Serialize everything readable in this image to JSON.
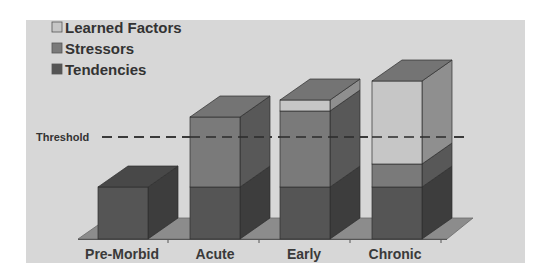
{
  "chart_data": {
    "type": "bar",
    "subtype": "stacked-3d",
    "title": "",
    "xlabel": "",
    "ylabel": "",
    "categories": [
      "Pre-Morbid",
      "Acute",
      "Early",
      "Chronic"
    ],
    "series": [
      {
        "name": "Tendencies",
        "values": [
          52,
          52,
          52,
          52
        ],
        "color": "#555555"
      },
      {
        "name": "Stressors",
        "values": [
          0,
          70,
          76,
          23
        ],
        "color": "#7a7a7a"
      },
      {
        "name": "Learned Factors",
        "values": [
          0,
          0,
          11,
          83
        ],
        "color": "#c6c6c6"
      }
    ],
    "legend": {
      "position": "top-left",
      "entries": [
        "Learned Factors",
        "Stressors",
        "Tendencies"
      ]
    },
    "annotations": [
      {
        "type": "hline",
        "label": "Threshold",
        "value": 102,
        "style": "dashed"
      }
    ],
    "ylim": [
      0,
      160
    ],
    "grid": false,
    "axis_ticks_visible": false
  },
  "colors": {
    "background": "#d7d7d7",
    "floor": "#8c8c8c",
    "threshold_line": "#3a3a3a"
  }
}
